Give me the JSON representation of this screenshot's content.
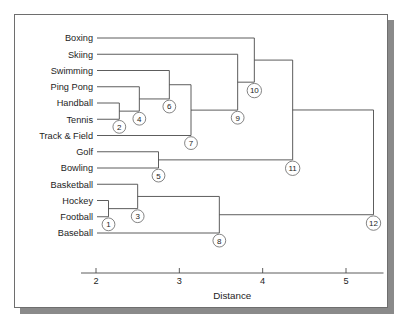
{
  "figure": {
    "axis_title": "Distance",
    "background": "#ffffff",
    "line_color": "#4b4b4b",
    "frame_color": "#6e6e6e",
    "shadow_color": "#8a8a8a"
  },
  "chart_data": {
    "type": "dendrogram",
    "title": "",
    "xlabel": "Distance",
    "ylabel": "",
    "xlim": [
      1.82,
      5.45
    ],
    "grid": false,
    "legend": null,
    "orientation": "horizontal",
    "leaves": [
      "Boxing",
      "Skiing",
      "Swimming",
      "Ping Pong",
      "Handball",
      "Tennis",
      "Track & Field",
      "Golf",
      "Bowling",
      "Basketball",
      "Hockey",
      "Football",
      "Baseball"
    ],
    "xticks": [
      2,
      3,
      4,
      5
    ],
    "xtick_labels": [
      "2",
      "3",
      "4",
      "5"
    ],
    "merges": [
      {
        "id": 1,
        "label": "1",
        "distance": 2.15,
        "children": [
          "Hockey",
          "Football"
        ]
      },
      {
        "id": 2,
        "label": "2",
        "distance": 2.28,
        "children": [
          "Handball",
          "Tennis"
        ]
      },
      {
        "id": 3,
        "label": "3",
        "distance": 2.5,
        "children": [
          "Basketball",
          "1"
        ]
      },
      {
        "id": 4,
        "label": "4",
        "distance": 2.52,
        "children": [
          "Ping Pong",
          "2"
        ]
      },
      {
        "id": 5,
        "label": "5",
        "distance": 2.75,
        "children": [
          "Golf",
          "Bowling"
        ]
      },
      {
        "id": 6,
        "label": "6",
        "distance": 2.88,
        "children": [
          "Swimming",
          "4"
        ]
      },
      {
        "id": 7,
        "label": "7",
        "distance": 3.14,
        "children": [
          "6",
          "Track & Field"
        ]
      },
      {
        "id": 8,
        "label": "8",
        "distance": 3.48,
        "children": [
          "3",
          "Baseball"
        ]
      },
      {
        "id": 9,
        "label": "9",
        "distance": 3.7,
        "children": [
          "Skiing",
          "7"
        ]
      },
      {
        "id": 10,
        "label": "10",
        "distance": 3.9,
        "children": [
          "Boxing",
          "9"
        ]
      },
      {
        "id": 11,
        "label": "11",
        "distance": 4.36,
        "children": [
          "10",
          "5"
        ]
      },
      {
        "id": 12,
        "label": "12",
        "distance": 5.33,
        "children": [
          "11",
          "8"
        ]
      }
    ]
  }
}
